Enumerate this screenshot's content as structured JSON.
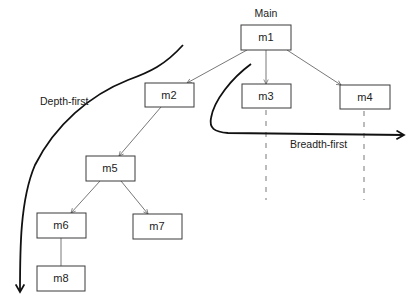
{
  "title": "Main",
  "labels": {
    "depth_first": "Depth-first",
    "breadth_first": "Breadth-first"
  },
  "nodes": {
    "m1": "m1",
    "m2": "m2",
    "m3": "m3",
    "m4": "m4",
    "m5": "m5",
    "m6": "m6",
    "m7": "m7",
    "m8": "m8"
  },
  "edges": [
    [
      "m1",
      "m2"
    ],
    [
      "m1",
      "m3"
    ],
    [
      "m1",
      "m4"
    ],
    [
      "m2",
      "m5"
    ],
    [
      "m5",
      "m6"
    ],
    [
      "m5",
      "m7"
    ],
    [
      "m6",
      "m8"
    ]
  ],
  "colors": {
    "stroke": "#3a3a3a",
    "text": "#222222",
    "background": "#ffffff"
  }
}
